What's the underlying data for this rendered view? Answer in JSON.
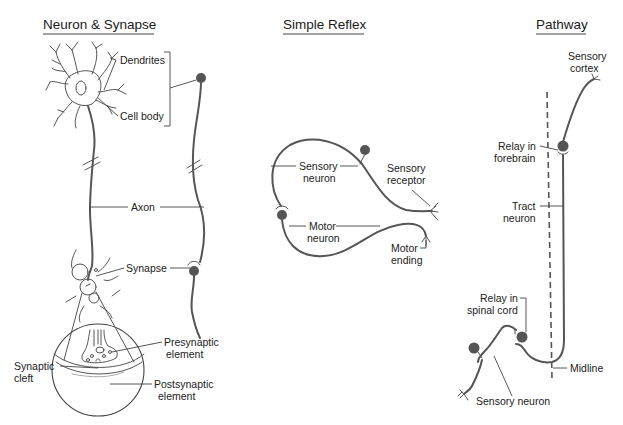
{
  "colors": {
    "background": "#ffffff",
    "ink": "#555555",
    "text": "#222222",
    "soma_fill": "#555555"
  },
  "panels": {
    "neuron_synapse": {
      "title": "Neuron & Synapse",
      "labels": {
        "dendrites": "Dendrites",
        "cell_body": "Cell body",
        "axon": "Axon",
        "synapse": "Synapse",
        "presynaptic_1": "Presynaptic",
        "presynaptic_2": "element",
        "synaptic_cleft_1": "Synaptic",
        "synaptic_cleft_2": "cleft",
        "postsynaptic_1": "Postsynaptic",
        "postsynaptic_2": "element"
      }
    },
    "simple_reflex": {
      "title": "Simple Reflex",
      "labels": {
        "sensory_neuron_1": "Sensory",
        "sensory_neuron_2": "neuron",
        "sensory_receptor_1": "Sensory",
        "sensory_receptor_2": "receptor",
        "motor_neuron_1": "Motor",
        "motor_neuron_2": "neuron",
        "motor_ending_1": "Motor",
        "motor_ending_2": "ending"
      }
    },
    "pathway": {
      "title": "Pathway",
      "labels": {
        "sensory_cortex_1": "Sensory",
        "sensory_cortex_2": "cortex",
        "relay_forebrain_1": "Relay in",
        "relay_forebrain_2": "forebrain",
        "tract_neuron_1": "Tract",
        "tract_neuron_2": "neuron",
        "relay_spinal_1": "Relay in",
        "relay_spinal_2": "spinal cord",
        "midline": "Midline",
        "sensory_neuron": "Sensory neuron"
      }
    }
  }
}
